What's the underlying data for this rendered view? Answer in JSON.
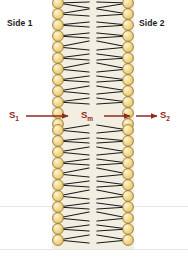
{
  "figure": {
    "background_color": "#ffffff",
    "membrane_fill": "#f2efe2",
    "head_fill": "#f2d98b",
    "head_stroke": "#8a6a28",
    "tail_color": "#1a1a1a",
    "arrow_color": "#8f2a20"
  },
  "labels": {
    "side1": "Side 1",
    "side2": "Side 2"
  },
  "flux": {
    "left": {
      "symbol": "S",
      "subscript": "1",
      "text": "S1"
    },
    "middle": {
      "symbol": "S",
      "subscript": "m",
      "text": "Sm"
    },
    "right": {
      "symbol": "S",
      "subscript": "2",
      "text": "S2"
    }
  },
  "membrane": {
    "left_edge_x": 52,
    "right_edge_x": 134,
    "top_y": 0,
    "bottom_y": 249,
    "lipid_rows": 23,
    "row_spacing_px": 11,
    "head_radius_px": 5.4
  },
  "arrows": {
    "left": {
      "x1": 26,
      "x2": 68,
      "y": 116
    },
    "middle": {
      "x1": 104,
      "x2": 130,
      "y": 116
    },
    "right": {
      "x1": 136,
      "x2": 157,
      "y": 116
    }
  }
}
